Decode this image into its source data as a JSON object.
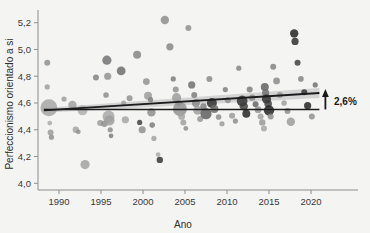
{
  "chart_data": {
    "type": "scatter",
    "title": "",
    "xlabel": "Ano",
    "ylabel": "Perfeccionismo orientado a si",
    "xlim": [
      1987.5,
      2022.5
    ],
    "ylim": [
      3.95,
      5.28
    ],
    "xticks": [
      1990,
      1995,
      2000,
      2005,
      2010,
      2015,
      2020
    ],
    "xticklabels": [
      "1990",
      "1995",
      "2000",
      "2005",
      "2010",
      "2015",
      "2020"
    ],
    "yticks": [
      4.0,
      4.2,
      4.4,
      4.6,
      4.8,
      5.0,
      5.2
    ],
    "yticklabels": [
      "4,0",
      "4,2",
      "4,4",
      "4,6",
      "4,8",
      "5,0",
      "5,2"
    ],
    "grid": false,
    "legend": "none",
    "annotations": [
      {
        "name": "increase-label",
        "text": "2,6%",
        "x": 2021.9,
        "y": 4.61,
        "arrow_from_y": 4.552,
        "arrow_to_y": 4.675,
        "arrow_x": 2021.0
      }
    ],
    "reference_line": {
      "name": "baseline",
      "y": 4.552,
      "x_start": 1988.2,
      "x_end": 2021.0,
      "color": "#1c1c1c"
    },
    "regression_line": {
      "name": "trend",
      "x_start": 1988.2,
      "y_start": 4.545,
      "x_end": 2021.0,
      "y_end": 4.675,
      "color": "#1c1c1c",
      "band_color": "#b9b9b9",
      "band_start_half_width": 0.018,
      "band_end_half_width": 0.038
    },
    "series": [
      {
        "name": "studies",
        "marker": "circle",
        "points": [
          {
            "x": 1988.6,
            "y": 4.9,
            "size": 3.0,
            "shade": "#8e8e8e"
          },
          {
            "x": 1988.6,
            "y": 4.72,
            "size": 2.6,
            "shade": "#9c9c9c"
          },
          {
            "x": 1988.8,
            "y": 4.565,
            "size": 8.5,
            "shade": "#a4a4a4"
          },
          {
            "x": 1988.9,
            "y": 4.45,
            "size": 2.4,
            "shade": "#a8a8a8"
          },
          {
            "x": 1989.0,
            "y": 4.38,
            "size": 3.0,
            "shade": "#9a9a9a"
          },
          {
            "x": 1989.1,
            "y": 4.345,
            "size": 2.6,
            "shade": "#8c8c8c"
          },
          {
            "x": 1990.6,
            "y": 4.63,
            "size": 2.6,
            "shade": "#9b9b9b"
          },
          {
            "x": 1991.6,
            "y": 4.585,
            "size": 4.2,
            "shade": "#9f9f9f"
          },
          {
            "x": 1992.0,
            "y": 4.4,
            "size": 3.2,
            "shade": "#a2a2a2"
          },
          {
            "x": 1992.3,
            "y": 4.385,
            "size": 2.4,
            "shade": "#8f8f8f"
          },
          {
            "x": 1992.8,
            "y": 4.545,
            "size": 5.0,
            "shade": "#adadad"
          },
          {
            "x": 1993.1,
            "y": 4.14,
            "size": 4.6,
            "shade": "#a0a0a0"
          },
          {
            "x": 1994.4,
            "y": 4.79,
            "size": 3.0,
            "shade": "#7f7f7f"
          },
          {
            "x": 1994.9,
            "y": 4.45,
            "size": 3.0,
            "shade": "#999999"
          },
          {
            "x": 1995.4,
            "y": 4.445,
            "size": 3.2,
            "shade": "#8e8e8e"
          },
          {
            "x": 1995.6,
            "y": 4.66,
            "size": 2.8,
            "shade": "#8a8a8a"
          },
          {
            "x": 1995.7,
            "y": 4.92,
            "size": 4.6,
            "shade": "#6f6f6f"
          },
          {
            "x": 1995.8,
            "y": 4.8,
            "size": 3.6,
            "shade": "#909090"
          },
          {
            "x": 1995.9,
            "y": 4.5,
            "size": 6.0,
            "shade": "#a6a6a6"
          },
          {
            "x": 1996.0,
            "y": 4.47,
            "size": 5.2,
            "shade": "#9e9e9e"
          },
          {
            "x": 1996.1,
            "y": 4.4,
            "size": 2.6,
            "shade": "#8a8a8a"
          },
          {
            "x": 1996.2,
            "y": 4.355,
            "size": 2.4,
            "shade": "#7b7b7b"
          },
          {
            "x": 1997.4,
            "y": 4.84,
            "size": 4.4,
            "shade": "#6a6a6a"
          },
          {
            "x": 1997.7,
            "y": 4.6,
            "size": 2.6,
            "shade": "#9d9d9d"
          },
          {
            "x": 1997.9,
            "y": 4.475,
            "size": 3.6,
            "shade": "#a3a3a3"
          },
          {
            "x": 1998.4,
            "y": 4.635,
            "size": 3.0,
            "shade": "#8f8f8f"
          },
          {
            "x": 1999.3,
            "y": 4.96,
            "size": 4.0,
            "shade": "#828282"
          },
          {
            "x": 1999.6,
            "y": 4.455,
            "size": 2.6,
            "shade": "#3a3a3a"
          },
          {
            "x": 1999.9,
            "y": 4.4,
            "size": 3.6,
            "shade": "#8c8c8c"
          },
          {
            "x": 2000.4,
            "y": 4.76,
            "size": 3.4,
            "shade": "#909090"
          },
          {
            "x": 2000.6,
            "y": 4.655,
            "size": 4.0,
            "shade": "#9a9a9a"
          },
          {
            "x": 2000.9,
            "y": 4.625,
            "size": 2.6,
            "shade": "#7e7e7e"
          },
          {
            "x": 2001.0,
            "y": 4.53,
            "size": 4.2,
            "shade": "#8b8b8b"
          },
          {
            "x": 2001.1,
            "y": 4.435,
            "size": 2.8,
            "shade": "#7a7a7a"
          },
          {
            "x": 2001.3,
            "y": 4.335,
            "size": 2.6,
            "shade": "#a0a0a0"
          },
          {
            "x": 2001.8,
            "y": 4.215,
            "size": 2.4,
            "shade": "#a8a8a8"
          },
          {
            "x": 2002.0,
            "y": 4.175,
            "size": 3.2,
            "shade": "#2f2f2f"
          },
          {
            "x": 2002.6,
            "y": 5.22,
            "size": 4.2,
            "shade": "#8a8a8a"
          },
          {
            "x": 2003.2,
            "y": 5.02,
            "size": 3.6,
            "shade": "#848484"
          },
          {
            "x": 2003.6,
            "y": 4.78,
            "size": 2.6,
            "shade": "#777777"
          },
          {
            "x": 2003.9,
            "y": 4.7,
            "size": 3.0,
            "shade": "#8d8d8d"
          },
          {
            "x": 2004.0,
            "y": 4.64,
            "size": 4.6,
            "shade": "#9b9b9b"
          },
          {
            "x": 2004.2,
            "y": 4.6,
            "size": 3.0,
            "shade": "#8e8e8e"
          },
          {
            "x": 2004.4,
            "y": 4.555,
            "size": 7.0,
            "shade": "#8f8f8f"
          },
          {
            "x": 2004.6,
            "y": 4.5,
            "size": 3.4,
            "shade": "#a2a2a2"
          },
          {
            "x": 2004.8,
            "y": 4.455,
            "size": 3.0,
            "shade": "#9e9e9e"
          },
          {
            "x": 2005.1,
            "y": 4.41,
            "size": 2.4,
            "shade": "#8a8a8a"
          },
          {
            "x": 2005.4,
            "y": 5.16,
            "size": 3.0,
            "shade": "#8d8d8d"
          },
          {
            "x": 2005.8,
            "y": 4.735,
            "size": 3.6,
            "shade": "#6d6d6d"
          },
          {
            "x": 2006.1,
            "y": 4.66,
            "size": 3.0,
            "shade": "#7a7a7a"
          },
          {
            "x": 2006.3,
            "y": 4.6,
            "size": 4.0,
            "shade": "#868686"
          },
          {
            "x": 2006.5,
            "y": 4.545,
            "size": 4.4,
            "shade": "#9d9d9d"
          },
          {
            "x": 2006.8,
            "y": 4.48,
            "size": 3.0,
            "shade": "#949494"
          },
          {
            "x": 2007.2,
            "y": 4.575,
            "size": 3.2,
            "shade": "#7e7e7e"
          },
          {
            "x": 2007.5,
            "y": 4.52,
            "size": 5.6,
            "shade": "#5a5a5a"
          },
          {
            "x": 2007.9,
            "y": 4.78,
            "size": 3.0,
            "shade": "#888888"
          },
          {
            "x": 2008.2,
            "y": 4.6,
            "size": 5.0,
            "shade": "#2a2a2a"
          },
          {
            "x": 2008.5,
            "y": 4.555,
            "size": 4.0,
            "shade": "#6a6a6a"
          },
          {
            "x": 2009.0,
            "y": 4.495,
            "size": 2.8,
            "shade": "#8b8b8b"
          },
          {
            "x": 2009.4,
            "y": 4.445,
            "size": 2.6,
            "shade": "#9a9a9a"
          },
          {
            "x": 2009.8,
            "y": 4.7,
            "size": 2.6,
            "shade": "#7c7c7c"
          },
          {
            "x": 2010.1,
            "y": 4.62,
            "size": 3.0,
            "shade": "#8e8e8e"
          },
          {
            "x": 2010.6,
            "y": 4.505,
            "size": 3.0,
            "shade": "#999999"
          },
          {
            "x": 2011.0,
            "y": 4.465,
            "size": 2.6,
            "shade": "#8a8a8a"
          },
          {
            "x": 2011.4,
            "y": 4.86,
            "size": 2.6,
            "shade": "#838383"
          },
          {
            "x": 2011.8,
            "y": 4.615,
            "size": 5.4,
            "shade": "#2c2c2c"
          },
          {
            "x": 2012.0,
            "y": 4.575,
            "size": 4.2,
            "shade": "#3d3d3d"
          },
          {
            "x": 2012.3,
            "y": 4.52,
            "size": 4.0,
            "shade": "#1f1f1f"
          },
          {
            "x": 2012.7,
            "y": 4.7,
            "size": 3.0,
            "shade": "#7b7b7b"
          },
          {
            "x": 2013.0,
            "y": 4.64,
            "size": 3.2,
            "shade": "#8a8a8a"
          },
          {
            "x": 2013.4,
            "y": 4.59,
            "size": 3.0,
            "shade": "#606060"
          },
          {
            "x": 2013.7,
            "y": 4.55,
            "size": 3.4,
            "shade": "#909090"
          },
          {
            "x": 2014.0,
            "y": 4.5,
            "size": 3.0,
            "shade": "#a0a0a0"
          },
          {
            "x": 2014.2,
            "y": 4.455,
            "size": 3.2,
            "shade": "#969696"
          },
          {
            "x": 2014.4,
            "y": 4.41,
            "size": 3.0,
            "shade": "#a4a4a4"
          },
          {
            "x": 2014.5,
            "y": 4.72,
            "size": 4.0,
            "shade": "#5e5e5e"
          },
          {
            "x": 2014.6,
            "y": 4.675,
            "size": 3.6,
            "shade": "#6b6b6b"
          },
          {
            "x": 2014.7,
            "y": 4.63,
            "size": 4.6,
            "shade": "#2b2b2b"
          },
          {
            "x": 2014.9,
            "y": 4.595,
            "size": 3.8,
            "shade": "#3a3a3a"
          },
          {
            "x": 2015.0,
            "y": 4.545,
            "size": 5.2,
            "shade": "#1e1e1e"
          },
          {
            "x": 2015.2,
            "y": 4.5,
            "size": 3.0,
            "shade": "#8d8d8d"
          },
          {
            "x": 2015.5,
            "y": 4.87,
            "size": 3.0,
            "shade": "#7f7f7f"
          },
          {
            "x": 2015.9,
            "y": 4.765,
            "size": 3.4,
            "shade": "#888888"
          },
          {
            "x": 2016.3,
            "y": 4.66,
            "size": 3.0,
            "shade": "#949494"
          },
          {
            "x": 2016.8,
            "y": 4.6,
            "size": 2.8,
            "shade": "#9c9c9c"
          },
          {
            "x": 2017.2,
            "y": 4.54,
            "size": 3.0,
            "shade": "#8b8b8b"
          },
          {
            "x": 2017.6,
            "y": 4.46,
            "size": 4.2,
            "shade": "#9a9a9a"
          },
          {
            "x": 2018.0,
            "y": 5.12,
            "size": 4.2,
            "shade": "#1c1c1c"
          },
          {
            "x": 2018.1,
            "y": 5.06,
            "size": 3.6,
            "shade": "#2a2a2a"
          },
          {
            "x": 2018.4,
            "y": 4.9,
            "size": 3.0,
            "shade": "#3a3a3a"
          },
          {
            "x": 2018.8,
            "y": 4.78,
            "size": 2.8,
            "shade": "#808080"
          },
          {
            "x": 2019.2,
            "y": 4.68,
            "size": 3.0,
            "shade": "#2e2e2e"
          },
          {
            "x": 2019.6,
            "y": 4.58,
            "size": 3.6,
            "shade": "#1f1f1f"
          },
          {
            "x": 2020.1,
            "y": 4.5,
            "size": 3.0,
            "shade": "#8d8d8d"
          },
          {
            "x": 2020.5,
            "y": 4.735,
            "size": 2.6,
            "shade": "#6c6c6c"
          }
        ]
      }
    ]
  }
}
